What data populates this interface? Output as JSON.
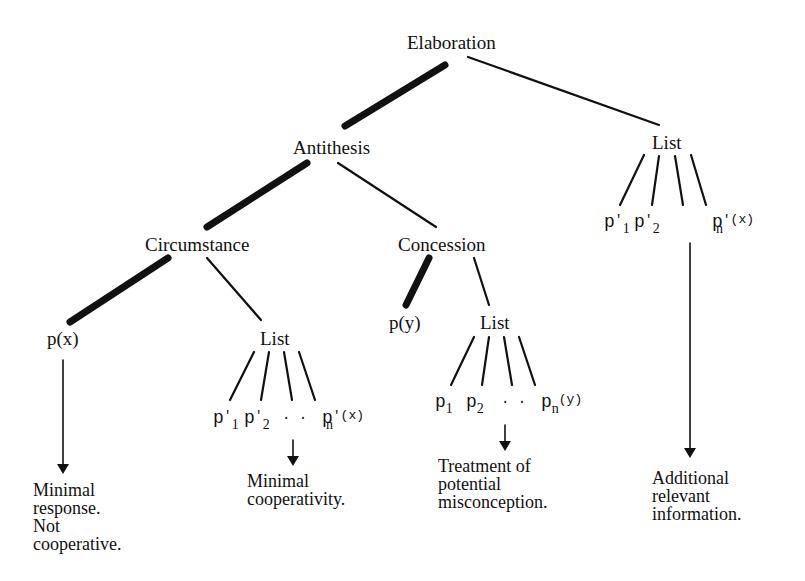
{
  "diagram": {
    "type": "rhetorical-structure-tree",
    "nodes": {
      "root": "Elaboration",
      "antithesis": "Antithesis",
      "list_right": "List",
      "circumstance": "Circumstance",
      "concession": "Concession",
      "px": "p(x)",
      "list_circ": "List",
      "py": "p(y)",
      "list_conc": "List"
    },
    "leaves": {
      "right_list": {
        "p1": "p",
        "p1_sub": "1",
        "p1_sup": "′",
        "p2": "p",
        "p2_sub": "2",
        "p2_sup": "′",
        "pn": "p",
        "pn_sub": "n",
        "pn_sup": "′(x)"
      },
      "circ_list": {
        "p1": "p",
        "p1_sub": "1",
        "p1_sup": "′",
        "p2": "p",
        "p2_sub": "2",
        "p2_sup": "′",
        "dots": "· ·",
        "pn": "p",
        "pn_sub": "n",
        "pn_sup": "′(x)"
      },
      "conc_list": {
        "p1": "p",
        "p1_sub": "1",
        "p2": "p",
        "p2_sub": "2",
        "dots": "· ·",
        "pn": "p",
        "pn_sub": "n",
        "pn_sup": "(y)"
      }
    },
    "notes": {
      "px": [
        "Minimal",
        "response.",
        "Not",
        "cooperative."
      ],
      "circ_list": [
        "Minimal",
        "cooperativity."
      ],
      "conc_list": [
        "Treatment of",
        "potential",
        "misconception."
      ],
      "right_list": [
        "Additional",
        "relevant",
        "information."
      ]
    },
    "edges": [
      {
        "from": "Elaboration",
        "to": "Antithesis",
        "style": "thick"
      },
      {
        "from": "Elaboration",
        "to": "List",
        "style": "thin"
      },
      {
        "from": "Antithesis",
        "to": "Circumstance",
        "style": "thick"
      },
      {
        "from": "Antithesis",
        "to": "Concession",
        "style": "thin"
      },
      {
        "from": "Circumstance",
        "to": "p(x)",
        "style": "thick"
      },
      {
        "from": "Circumstance",
        "to": "List",
        "style": "thin"
      },
      {
        "from": "Concession",
        "to": "p(y)",
        "style": "thick"
      },
      {
        "from": "Concession",
        "to": "List",
        "style": "thin"
      }
    ]
  }
}
